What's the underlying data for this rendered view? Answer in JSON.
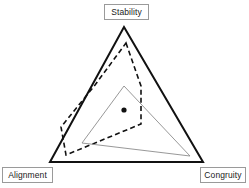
{
  "figure": {
    "type": "ternary-triangle-diagram",
    "background_color": "#ffffff",
    "width": 249,
    "height": 188
  },
  "labels": {
    "top": "Stability",
    "bottom_left": "Alignment",
    "bottom_right": "Congruity"
  },
  "chart_data": {
    "type": "scatter",
    "title": "",
    "xlabel": "",
    "ylabel": "",
    "grid": false,
    "legend": "none",
    "axes": [
      {
        "name": "Stability",
        "position": "top",
        "vertex": [
          124,
          27
        ]
      },
      {
        "name": "Alignment",
        "position": "bottom-left",
        "vertex": [
          50,
          162
        ]
      },
      {
        "name": "Congruity",
        "position": "bottom-right",
        "vertex": [
          203,
          162
        ]
      }
    ],
    "series": [
      {
        "name": "outer-boundary-triangle",
        "style": "solid",
        "color": "#111111",
        "stroke_width": 2,
        "closed": true,
        "points": [
          [
            124,
            27
          ],
          [
            203,
            162
          ],
          [
            50,
            162
          ]
        ]
      },
      {
        "name": "dashed-profile-polygon",
        "style": "dashed",
        "color": "#111111",
        "stroke_width": 1.6,
        "closed": true,
        "points": [
          [
            126,
            43
          ],
          [
            141,
            86
          ],
          [
            141,
            124
          ],
          [
            66,
            155
          ],
          [
            61,
            127
          ],
          [
            95,
            85
          ]
        ]
      },
      {
        "name": "thin-profile-triangle",
        "style": "solid",
        "color": "#8c8c8c",
        "stroke_width": 0.9,
        "closed": true,
        "points": [
          [
            124,
            86
          ],
          [
            190,
            156
          ],
          [
            82,
            143
          ]
        ]
      }
    ],
    "markers": [
      {
        "name": "centroid-point",
        "shape": "circle",
        "color": "#111111",
        "radius": 2.6,
        "x": 124,
        "y": 110
      }
    ]
  }
}
